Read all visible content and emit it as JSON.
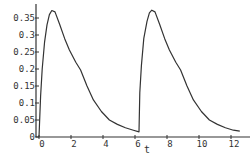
{
  "chart_data": {
    "type": "line",
    "title": "",
    "xlabel": "t",
    "ylabel": "",
    "xlim": [
      -0.2,
      13.2
    ],
    "ylim": [
      0,
      0.375
    ],
    "grid": false,
    "legend": null,
    "x_ticks": [
      0,
      2,
      4,
      6,
      8,
      10,
      12
    ],
    "x_tick_labels": [
      "0",
      "2",
      "4",
      "6",
      "8",
      "10",
      "12"
    ],
    "y_ticks": [
      0,
      0.05,
      0.1,
      0.15,
      0.2,
      0.25,
      0.3,
      0.35
    ],
    "y_tick_labels": [
      "0",
      "0.05",
      "0.1",
      "0.15",
      "0.2",
      "0.25",
      "0.3",
      "0.35"
    ],
    "series": [
      {
        "name": "concentration",
        "color": "#333333",
        "x": [
          0,
          0.1,
          0.2,
          0.35,
          0.5,
          0.65,
          0.8,
          1.0,
          1.3,
          1.6,
          1.9,
          2.3,
          2.6,
          3.0,
          3.4,
          3.9,
          4.4,
          4.9,
          5.4,
          5.9,
          6.25,
          6.3,
          6.4,
          6.55,
          6.75,
          6.9,
          7.05,
          7.25,
          7.55,
          7.85,
          8.15,
          8.55,
          8.85,
          9.25,
          9.65,
          10.15,
          10.65,
          11.15,
          11.65,
          12.15,
          12.55
        ],
        "y": [
          0.0,
          0.12,
          0.2,
          0.28,
          0.33,
          0.36,
          0.372,
          0.368,
          0.33,
          0.29,
          0.256,
          0.22,
          0.197,
          0.15,
          0.109,
          0.075,
          0.05,
          0.037,
          0.027,
          0.02,
          0.015,
          0.13,
          0.21,
          0.29,
          0.34,
          0.365,
          0.373,
          0.368,
          0.33,
          0.29,
          0.256,
          0.22,
          0.197,
          0.15,
          0.109,
          0.075,
          0.05,
          0.037,
          0.027,
          0.02,
          0.017
        ]
      }
    ]
  }
}
